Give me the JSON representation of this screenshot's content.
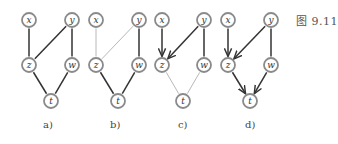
{
  "caption": "图 9.11",
  "node_style": {
    "radius": 7,
    "stroke": "#8a8a8a",
    "fill": "#ffffff",
    "text_color": "#333333"
  },
  "edge_colors": {
    "dark": "#333333",
    "light": "#b8b8b8"
  },
  "panels": [
    {
      "id": "a",
      "label": "a)",
      "label_x": 43,
      "nodes": {
        "x": [
          29,
          20
        ],
        "y": [
          72,
          20
        ],
        "z": [
          29,
          65
        ],
        "w": [
          72,
          65
        ],
        "t": [
          51,
          101
        ]
      },
      "edges": [
        {
          "from": "x",
          "to": "z",
          "style": "dark",
          "directed": false
        },
        {
          "from": "y",
          "to": "z",
          "style": "dark",
          "directed": false
        },
        {
          "from": "y",
          "to": "w",
          "style": "dark",
          "directed": false
        },
        {
          "from": "z",
          "to": "t",
          "style": "dark",
          "directed": false
        },
        {
          "from": "w",
          "to": "t",
          "style": "dark",
          "directed": false
        }
      ]
    },
    {
      "id": "b",
      "label": "b)",
      "label_x": 110,
      "nodes": {
        "x": [
          96,
          20
        ],
        "y": [
          139,
          20
        ],
        "z": [
          96,
          65
        ],
        "w": [
          139,
          65
        ],
        "t": [
          118,
          101
        ]
      },
      "edges": [
        {
          "from": "x",
          "to": "z",
          "style": "light",
          "directed": false
        },
        {
          "from": "y",
          "to": "z",
          "style": "light",
          "directed": false
        },
        {
          "from": "y",
          "to": "w",
          "style": "dark",
          "directed": false
        },
        {
          "from": "z",
          "to": "t",
          "style": "dark",
          "directed": false
        },
        {
          "from": "w",
          "to": "t",
          "style": "dark",
          "directed": false
        }
      ]
    },
    {
      "id": "c",
      "label": "c)",
      "label_x": 178,
      "nodes": {
        "x": [
          162,
          20
        ],
        "y": [
          204,
          20
        ],
        "z": [
          162,
          65
        ],
        "w": [
          204,
          65
        ],
        "t": [
          183,
          101
        ]
      },
      "edges": [
        {
          "from": "x",
          "to": "z",
          "style": "dark",
          "directed": true
        },
        {
          "from": "y",
          "to": "z",
          "style": "dark",
          "directed": true
        },
        {
          "from": "y",
          "to": "w",
          "style": "dark",
          "directed": false
        },
        {
          "from": "z",
          "to": "t",
          "style": "light",
          "directed": false
        },
        {
          "from": "w",
          "to": "t",
          "style": "light",
          "directed": false
        }
      ]
    },
    {
      "id": "d",
      "label": "d)",
      "label_x": 245,
      "nodes": {
        "x": [
          228,
          20
        ],
        "y": [
          271,
          20
        ],
        "z": [
          228,
          65
        ],
        "w": [
          271,
          65
        ],
        "t": [
          250,
          101
        ]
      },
      "edges": [
        {
          "from": "x",
          "to": "z",
          "style": "dark",
          "directed": true
        },
        {
          "from": "y",
          "to": "z",
          "style": "dark",
          "directed": true
        },
        {
          "from": "y",
          "to": "w",
          "style": "dark",
          "directed": false
        },
        {
          "from": "z",
          "to": "t",
          "style": "dark",
          "directed": true
        },
        {
          "from": "w",
          "to": "t",
          "style": "dark",
          "directed": true
        }
      ]
    }
  ]
}
